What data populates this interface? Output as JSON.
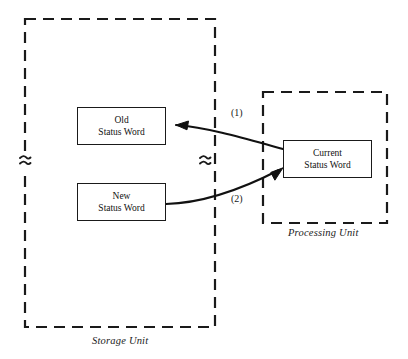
{
  "diagram": {
    "background_color": "#ffffff",
    "line_color": "#1a1a1a",
    "containers": [
      {
        "id": "storage-unit",
        "caption": "Storage Unit",
        "border_style": "dashed",
        "break_symbol": "≈"
      },
      {
        "id": "processing-unit",
        "caption": "Processing Unit",
        "border_style": "dashed"
      }
    ],
    "nodes": [
      {
        "id": "old-status-word",
        "line1": "Old",
        "line2": "Status Word"
      },
      {
        "id": "new-status-word",
        "line1": "New",
        "line2": "Status Word"
      },
      {
        "id": "current-status-word",
        "line1": "Current",
        "line2": "Status Word"
      }
    ],
    "flows": [
      {
        "id": "flow-1",
        "label": "(1)",
        "from": "current-status-word",
        "to": "old-status-word"
      },
      {
        "id": "flow-2",
        "label": "(2)",
        "from": "new-status-word",
        "to": "current-status-word"
      }
    ],
    "break_symbols": [
      {
        "id": "break-left",
        "glyph": "≈"
      },
      {
        "id": "break-middle",
        "glyph": "≈"
      }
    ]
  }
}
